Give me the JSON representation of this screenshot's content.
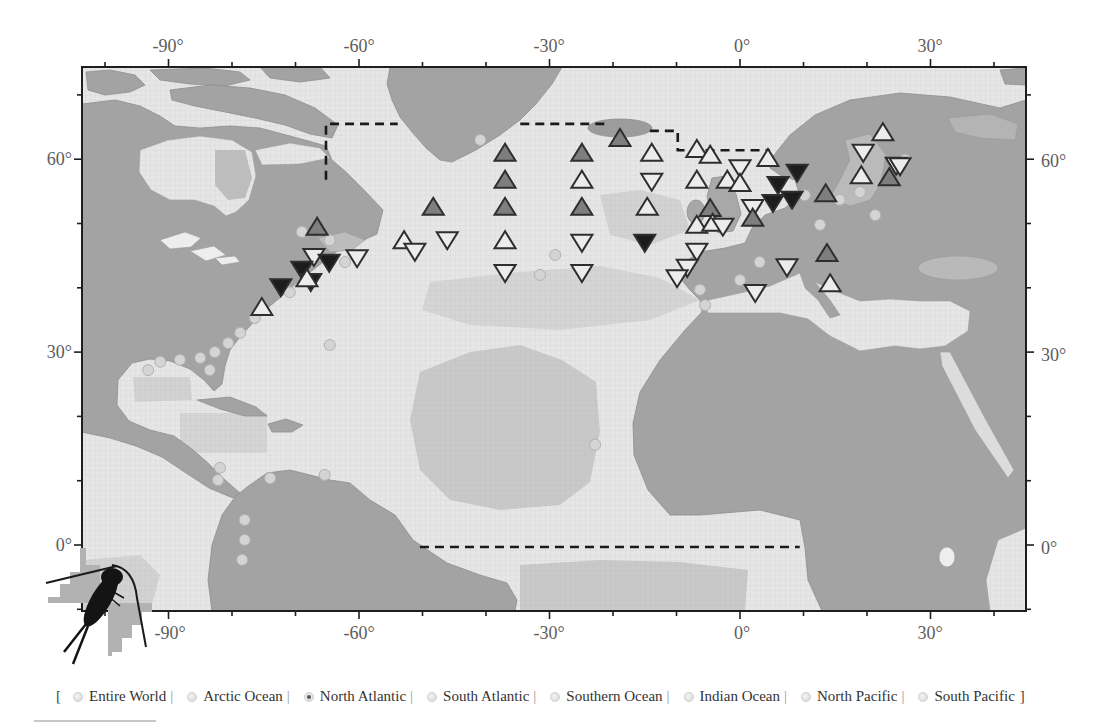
{
  "map": {
    "region": "North Atlantic",
    "axes": {
      "lon_ticks": [
        -100,
        -90,
        -80,
        -70,
        -60,
        -50,
        -40,
        -30,
        -20,
        -10,
        0,
        10,
        20,
        30,
        40
      ],
      "lat_ticks": [
        -10,
        0,
        10,
        20,
        30,
        40,
        50,
        60,
        70
      ],
      "major_lon": [
        -90,
        -60,
        -30,
        0,
        30
      ],
      "major_lat": [
        0,
        30,
        60
      ],
      "top_labels": [
        "-90°",
        "-60°",
        "-30°",
        "0°",
        "30°"
      ],
      "bottom_labels": [
        "-90°",
        "-60°",
        "-30°",
        "0°",
        "30°"
      ],
      "left_labels": [
        "60°",
        "30°",
        "0°"
      ],
      "right_labels": [
        "60°",
        "30°",
        "0°"
      ]
    },
    "marker_colors": {
      "white": "#ececec",
      "gray": "#7e7e7e",
      "black": "#1c1c1c",
      "stroke": "#2e2e2e"
    },
    "markers": [
      {
        "lon": -66.6,
        "lat": 49.5,
        "dir": "up",
        "fill": "gray"
      },
      {
        "lon": -67.1,
        "lat": 44.8,
        "dir": "down",
        "fill": "white"
      },
      {
        "lon": -64.7,
        "lat": 43.9,
        "dir": "down",
        "fill": "black"
      },
      {
        "lon": -60.3,
        "lat": 44.6,
        "dir": "down",
        "fill": "white"
      },
      {
        "lon": -69.0,
        "lat": 42.8,
        "dir": "down",
        "fill": "black"
      },
      {
        "lon": -67.6,
        "lat": 40.9,
        "dir": "down",
        "fill": "black"
      },
      {
        "lon": -68.2,
        "lat": 41.5,
        "dir": "up",
        "fill": "white"
      },
      {
        "lon": -72.3,
        "lat": 40.1,
        "dir": "down",
        "fill": "black"
      },
      {
        "lon": -75.3,
        "lat": 37.0,
        "dir": "up",
        "fill": "white"
      },
      {
        "lon": -52.9,
        "lat": 47.4,
        "dir": "up",
        "fill": "white"
      },
      {
        "lon": -51.2,
        "lat": 45.6,
        "dir": "down",
        "fill": "white"
      },
      {
        "lon": -48.3,
        "lat": 52.6,
        "dir": "up",
        "fill": "gray"
      },
      {
        "lon": -46.1,
        "lat": 47.4,
        "dir": "down",
        "fill": "white"
      },
      {
        "lon": -37.0,
        "lat": 61.0,
        "dir": "up",
        "fill": "gray"
      },
      {
        "lon": -37.0,
        "lat": 56.8,
        "dir": "up",
        "fill": "gray"
      },
      {
        "lon": -37.0,
        "lat": 52.6,
        "dir": "up",
        "fill": "gray"
      },
      {
        "lon": -37.0,
        "lat": 47.4,
        "dir": "up",
        "fill": "white"
      },
      {
        "lon": -37.0,
        "lat": 42.3,
        "dir": "down",
        "fill": "white"
      },
      {
        "lon": -18.9,
        "lat": 63.3,
        "dir": "up",
        "fill": "gray"
      },
      {
        "lon": -24.9,
        "lat": 61.0,
        "dir": "up",
        "fill": "gray"
      },
      {
        "lon": -24.9,
        "lat": 56.8,
        "dir": "up",
        "fill": "white"
      },
      {
        "lon": -24.9,
        "lat": 52.6,
        "dir": "up",
        "fill": "gray"
      },
      {
        "lon": -24.9,
        "lat": 47.0,
        "dir": "down",
        "fill": "white"
      },
      {
        "lon": -24.9,
        "lat": 42.3,
        "dir": "down",
        "fill": "white"
      },
      {
        "lon": -13.9,
        "lat": 61.0,
        "dir": "up",
        "fill": "white"
      },
      {
        "lon": -13.9,
        "lat": 56.5,
        "dir": "down",
        "fill": "white"
      },
      {
        "lon": -14.6,
        "lat": 52.6,
        "dir": "up",
        "fill": "white"
      },
      {
        "lon": -15.0,
        "lat": 47.0,
        "dir": "down",
        "fill": "black"
      },
      {
        "lon": -6.8,
        "lat": 61.6,
        "dir": "up",
        "fill": "white"
      },
      {
        "lon": -4.7,
        "lat": 60.7,
        "dir": "up",
        "fill": "white"
      },
      {
        "lon": -6.8,
        "lat": 56.8,
        "dir": "up",
        "fill": "white"
      },
      {
        "lon": -2.0,
        "lat": 56.8,
        "dir": "up",
        "fill": "white"
      },
      {
        "lon": 0.0,
        "lat": 58.6,
        "dir": "down",
        "fill": "white"
      },
      {
        "lon": 0.0,
        "lat": 56.3,
        "dir": "up",
        "fill": "white"
      },
      {
        "lon": 4.4,
        "lat": 60.2,
        "dir": "up",
        "fill": "white"
      },
      {
        "lon": 9.0,
        "lat": 57.9,
        "dir": "down",
        "fill": "black"
      },
      {
        "lon": 6.0,
        "lat": 56.0,
        "dir": "down",
        "fill": "black"
      },
      {
        "lon": 5.2,
        "lat": 53.2,
        "dir": "down",
        "fill": "black"
      },
      {
        "lon": 8.2,
        "lat": 53.7,
        "dir": "down",
        "fill": "black"
      },
      {
        "lon": 13.5,
        "lat": 54.7,
        "dir": "up",
        "fill": "gray"
      },
      {
        "lon": -4.7,
        "lat": 52.4,
        "dir": "up",
        "fill": "gray"
      },
      {
        "lon": 2.0,
        "lat": 52.4,
        "dir": "down",
        "fill": "white"
      },
      {
        "lon": 2.0,
        "lat": 50.9,
        "dir": "up",
        "fill": "gray"
      },
      {
        "lon": -6.8,
        "lat": 49.8,
        "dir": "up",
        "fill": "white"
      },
      {
        "lon": -4.3,
        "lat": 50.1,
        "dir": "up",
        "fill": "white"
      },
      {
        "lon": -2.7,
        "lat": 49.5,
        "dir": "down",
        "fill": "white"
      },
      {
        "lon": -6.8,
        "lat": 45.6,
        "dir": "down",
        "fill": "white"
      },
      {
        "lon": -8.3,
        "lat": 43.1,
        "dir": "down",
        "fill": "white"
      },
      {
        "lon": -9.9,
        "lat": 41.5,
        "dir": "down",
        "fill": "white"
      },
      {
        "lon": 13.7,
        "lat": 45.4,
        "dir": "up",
        "fill": "gray"
      },
      {
        "lon": 7.4,
        "lat": 43.2,
        "dir": "down",
        "fill": "white"
      },
      {
        "lon": 14.2,
        "lat": 40.7,
        "dir": "up",
        "fill": "white"
      },
      {
        "lon": 2.4,
        "lat": 39.2,
        "dir": "down",
        "fill": "white"
      },
      {
        "lon": 22.5,
        "lat": 64.2,
        "dir": "up",
        "fill": "white"
      },
      {
        "lon": 19.4,
        "lat": 61.0,
        "dir": "down",
        "fill": "white"
      },
      {
        "lon": 19.1,
        "lat": 57.5,
        "dir": "up",
        "fill": "white"
      },
      {
        "lon": 24.6,
        "lat": 59.0,
        "dir": "down",
        "fill": "white"
      },
      {
        "lon": 25.2,
        "lat": 58.9,
        "dir": "down",
        "fill": "white"
      },
      {
        "lon": 23.5,
        "lat": 57.2,
        "dir": "up",
        "fill": "gray"
      }
    ],
    "sites": [
      [
        -69.0,
        48.7
      ],
      [
        -64.6,
        47.4
      ],
      [
        -62.2,
        44.0
      ],
      [
        -70.9,
        39.3
      ],
      [
        -76.4,
        35.3
      ],
      [
        -78.7,
        33.0
      ],
      [
        -80.6,
        31.4
      ],
      [
        -82.7,
        30.0
      ],
      [
        -85.0,
        29.1
      ],
      [
        -88.2,
        28.8
      ],
      [
        -91.3,
        28.5
      ],
      [
        -93.2,
        27.2
      ],
      [
        -83.5,
        27.2
      ],
      [
        -64.6,
        31.1
      ],
      [
        -81.9,
        12.0
      ],
      [
        -82.2,
        10.1
      ],
      [
        -78.0,
        3.9
      ],
      [
        -78.0,
        0.8
      ],
      [
        -78.4,
        -2.3
      ],
      [
        -74.0,
        10.4
      ],
      [
        -65.4,
        10.9
      ],
      [
        -22.8,
        15.6
      ],
      [
        -29.1,
        45.1
      ],
      [
        -31.5,
        42.0
      ],
      [
        -40.9,
        63.0
      ],
      [
        10.2,
        54.4
      ],
      [
        15.7,
        53.7
      ],
      [
        18.9,
        54.9
      ],
      [
        21.3,
        51.3
      ],
      [
        3.1,
        44.0
      ],
      [
        0.0,
        41.2
      ],
      [
        -5.5,
        37.3
      ],
      [
        12.6,
        49.8
      ],
      [
        26.0,
        59.9
      ],
      [
        -6.3,
        39.7
      ]
    ],
    "boundary": [
      [
        [
          -65.2,
          56.8
        ],
        [
          -65.2,
          65.5
        ],
        [
          -53.9,
          65.5
        ]
      ],
      [
        [
          -34.6,
          65.5
        ],
        [
          -21.3,
          65.5
        ]
      ],
      [
        [
          -14.2,
          64.4
        ],
        [
          -9.8,
          64.4
        ],
        [
          -9.8,
          61.4
        ],
        [
          4.7,
          61.4
        ]
      ],
      [
        [
          -50.4,
          -0.3
        ],
        [
          9.4,
          -0.3
        ]
      ]
    ]
  },
  "region_selector": {
    "open_bracket": "[",
    "close_bracket": "]",
    "separator": "|",
    "options": [
      {
        "label": "Entire World",
        "checked": false
      },
      {
        "label": "Arctic Ocean",
        "checked": false
      },
      {
        "label": "North Atlantic",
        "checked": true
      },
      {
        "label": "South Atlantic",
        "checked": false
      },
      {
        "label": "Southern Ocean",
        "checked": false
      },
      {
        "label": "Indian Ocean",
        "checked": false
      },
      {
        "label": "North Pacific",
        "checked": false
      },
      {
        "label": "South Pacific",
        "checked": false
      }
    ]
  }
}
